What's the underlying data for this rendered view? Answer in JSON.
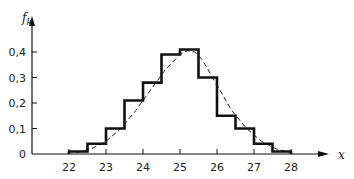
{
  "chart_data": {
    "type": "bar",
    "subtype": "histogram-with-fitted-curve",
    "title": "",
    "xlabel": "x",
    "ylabel": "f_k",
    "ylabel_main": "f",
    "ylabel_sub": "k",
    "xlim": [
      20.3,
      29.5
    ],
    "ylim": [
      0,
      0.47
    ],
    "grid": false,
    "legend": null,
    "x_ticks": [
      22,
      23,
      24,
      25,
      26,
      27,
      28
    ],
    "y_ticks": [
      0,
      0.1,
      0.2,
      0.3,
      0.4
    ],
    "y_tick_labels": [
      "0",
      "0,1",
      "0,2",
      "0,3",
      "0,4"
    ],
    "bin_width": 0.5,
    "bin_edges": [
      22,
      22.5,
      23,
      23.5,
      24,
      24.5,
      25,
      25.5,
      26,
      26.5,
      27,
      27.5,
      28
    ],
    "series": [
      {
        "name": "histogram",
        "style": "solid-step",
        "values": [
          0.01,
          0.04,
          0.1,
          0.21,
          0.28,
          0.39,
          0.41,
          0.3,
          0.15,
          0.1,
          0.04,
          0.01
        ]
      },
      {
        "name": "fitted-density",
        "style": "dashed",
        "x": [
          22.2,
          22.6,
          23.0,
          23.4,
          23.8,
          24.2,
          24.6,
          25.0,
          25.2,
          25.4,
          25.6,
          26.0,
          26.4,
          26.8,
          27.2,
          27.6,
          28.0
        ],
        "values": [
          0.005,
          0.02,
          0.05,
          0.1,
          0.17,
          0.25,
          0.33,
          0.39,
          0.405,
          0.4,
          0.37,
          0.27,
          0.17,
          0.1,
          0.05,
          0.02,
          0.005
        ]
      }
    ]
  }
}
